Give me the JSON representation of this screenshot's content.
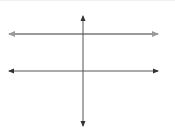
{
  "diagram": {
    "lines": [
      {
        "id": "top-horizontal",
        "x1": 7,
        "y1": 33,
        "x2": 160,
        "y2": 33,
        "color": "#9a9a9a",
        "width": 2,
        "arrows": "both"
      },
      {
        "id": "bottom-horizontal",
        "x1": 7,
        "y1": 70,
        "x2": 160,
        "y2": 70,
        "color": "#555555",
        "width": 1,
        "arrows": "both"
      },
      {
        "id": "vertical-transversal",
        "x1": 83,
        "y1": 13,
        "x2": 83,
        "y2": 127,
        "color": "#555555",
        "width": 1,
        "arrows": "both"
      }
    ]
  }
}
